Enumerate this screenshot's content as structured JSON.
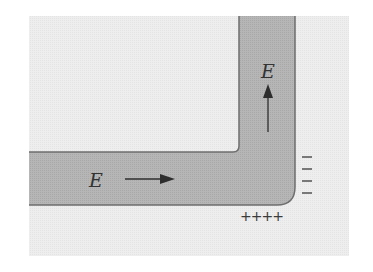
{
  "diagram": {
    "colors": {
      "background_panel": "#ececec",
      "wire_fill": "#b3b3b3",
      "wire_edge": "#6e6e6e",
      "inner_region": "#f0f0f0",
      "ink": "#2e2e2e"
    },
    "labels": {
      "horizontal_field": "E",
      "vertical_field": "E",
      "negative_charges": [
        "−",
        "−",
        "−",
        "−"
      ],
      "positive_charges": "++++"
    },
    "arrows": {
      "horizontal": {
        "direction": "right"
      },
      "vertical": {
        "direction": "up"
      }
    }
  }
}
